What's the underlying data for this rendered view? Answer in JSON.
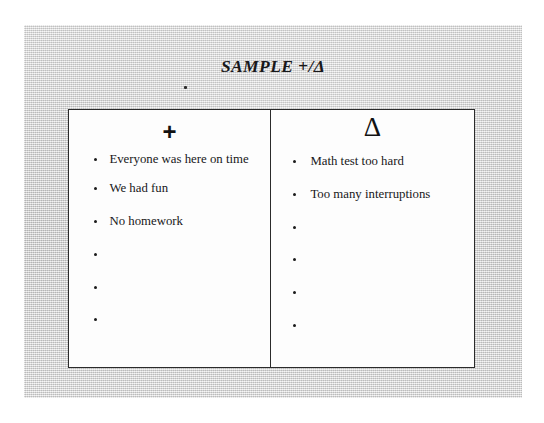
{
  "document": {
    "title": "SAMPLE +/Δ",
    "stray_mark": "scan-speck"
  },
  "table": {
    "columns": [
      {
        "header": "+",
        "header_name": "plus-sign",
        "items": [
          "Everyone was here on time",
          "We had fun",
          "No homework",
          "",
          "",
          ""
        ]
      },
      {
        "header": "Δ",
        "header_name": "delta-sign",
        "items": [
          "Math test too hard",
          "Too many interruptions",
          "",
          "",
          "",
          ""
        ]
      }
    ]
  },
  "colors": {
    "page_background": "#d2d2d2",
    "paper": "#fdfdfd",
    "ink": "#18181a",
    "border": "#2b2b2b"
  }
}
